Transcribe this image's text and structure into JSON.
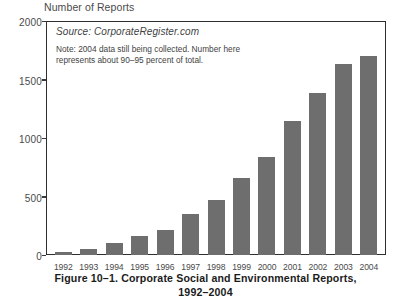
{
  "chart_data": {
    "type": "bar",
    "title": "Number of Reports",
    "xlabel": "",
    "ylabel": "Number of Reports",
    "ylim": [
      0,
      2000
    ],
    "grid": false,
    "legend": false,
    "bar_color": "#6e6e6e",
    "categories": [
      "1992",
      "1993",
      "1994",
      "1995",
      "1996",
      "1997",
      "1998",
      "1999",
      "2000",
      "2001",
      "2002",
      "2003",
      "2004"
    ],
    "values": [
      25,
      50,
      100,
      160,
      215,
      350,
      470,
      660,
      840,
      1150,
      1390,
      1640,
      1710
    ],
    "y_ticks": [
      "0",
      "500",
      "1000",
      "1500",
      "2000"
    ],
    "y_tick_values": [
      0,
      500,
      1000,
      1500,
      2000
    ],
    "annotations": {
      "source": "Source: CorporateRegister.com",
      "note": "Note: 2004 data still being collected. Number here represents about 90–95 percent of total."
    }
  },
  "caption": {
    "line1": "Figure 10–1.  Corporate Social and Environmental Reports,",
    "line2": "1992–2004"
  }
}
